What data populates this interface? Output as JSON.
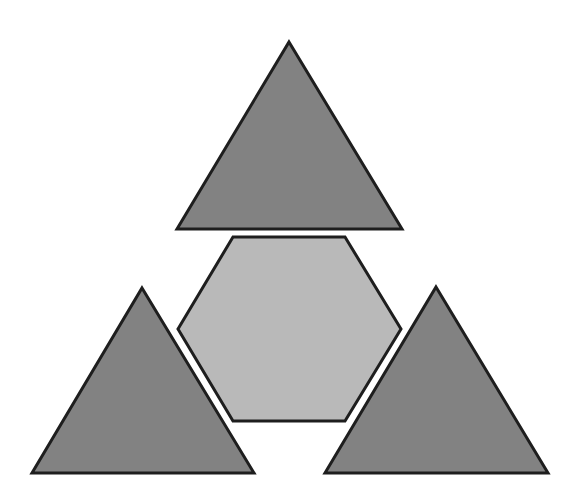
{
  "canvas": {
    "width": 582,
    "height": 493,
    "background": "#ffffff"
  },
  "style": {
    "triangle_fill": "#828282",
    "hexagon_fill": "#b9b9b9",
    "stroke": "#1e1e1e",
    "stroke_width": 3
  },
  "shapes": {
    "top_triangle": {
      "points": "289,42 402,229 177,229"
    },
    "left_triangle": {
      "points": "142,288 254,473 32,473"
    },
    "right_triangle": {
      "points": "436,287 548,473 325,473"
    },
    "center_hexagon": {
      "points": "233,237 345,237 401,329 345,421 233,421 178,329"
    }
  }
}
